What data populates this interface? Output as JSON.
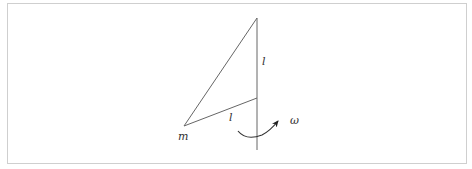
{
  "diagram": {
    "labels": {
      "mass": "m",
      "upper_length": "l",
      "lower_length": "l",
      "angular_velocity": "ω"
    },
    "colors": {
      "line": "#555555",
      "border": "#cfcfcf"
    }
  }
}
